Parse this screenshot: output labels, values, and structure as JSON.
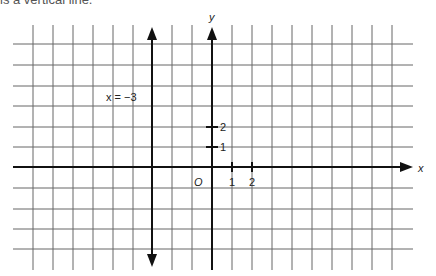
{
  "caption": "is a vertical line.",
  "axes": {
    "x_label": "x",
    "y_label": "y",
    "origin_label": "O",
    "x_ticks": [
      "1",
      "2"
    ],
    "y_ticks": [
      "1",
      "2"
    ]
  },
  "line": {
    "equation_label": "x = −3",
    "x_value": -3,
    "orientation": "vertical"
  },
  "grid": {
    "columns": 20,
    "rows": 11,
    "unit_px": 20,
    "line_color": "#555555",
    "axis_color": "#111111"
  }
}
